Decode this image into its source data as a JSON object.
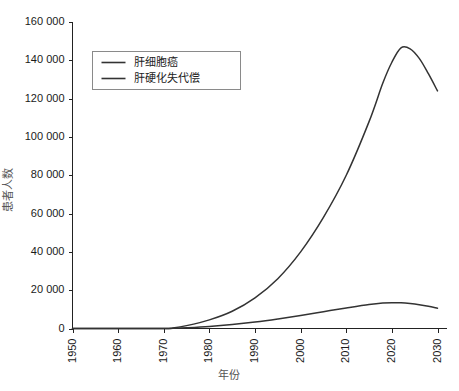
{
  "chart_data": {
    "type": "line",
    "title": "",
    "xlabel": "年份",
    "ylabel": "患者人数",
    "xlim": [
      1950,
      2030
    ],
    "ylim": [
      0,
      160000
    ],
    "grid": false,
    "legend_position": "top-left",
    "x_ticks": [
      "1950",
      "1960",
      "1970",
      "1980",
      "1990",
      "2000",
      "2010",
      "2020",
      "2030"
    ],
    "x_tick_values": [
      1950,
      1960,
      1970,
      1980,
      1990,
      2000,
      2010,
      2020,
      2030
    ],
    "y_ticks": [
      "0",
      "20 000",
      "40 000",
      "60 000",
      "80 000",
      "100 000",
      "120 000",
      "140 000",
      "160 000"
    ],
    "y_tick_values": [
      0,
      20000,
      40000,
      60000,
      80000,
      100000,
      120000,
      140000,
      160000
    ],
    "series": [
      {
        "name": "肝细胞癌",
        "color": "#333333",
        "x": [
          1950,
          1960,
          1970,
          1972,
          1975,
          1980,
          1985,
          1990,
          1995,
          2000,
          2005,
          2010,
          2015,
          2018,
          2020,
          2022,
          2024,
          2026,
          2028,
          2030
        ],
        "values": [
          0,
          0,
          0,
          300,
          1500,
          4500,
          9000,
          16000,
          26000,
          40000,
          58000,
          80000,
          108000,
          128000,
          139000,
          146500,
          146000,
          141000,
          133000,
          124000
        ]
      },
      {
        "name": "肝硬化失代偿",
        "color": "#333333",
        "x": [
          1950,
          1960,
          1970,
          1972,
          1975,
          1980,
          1985,
          1990,
          1995,
          2000,
          2005,
          2010,
          2015,
          2018,
          2020,
          2022,
          2024,
          2026,
          2028,
          2030
        ],
        "values": [
          0,
          0,
          0,
          100,
          400,
          1100,
          2100,
          3400,
          5000,
          6800,
          8800,
          10700,
          12500,
          13300,
          13500,
          13400,
          13000,
          12400,
          11600,
          10600
        ]
      }
    ]
  },
  "legend": {
    "entries": [
      {
        "label": "肝细胞癌"
      },
      {
        "label": "肝硬化失代偿"
      }
    ]
  },
  "axes": {
    "x_title": "年份",
    "y_title": "患者人数"
  }
}
